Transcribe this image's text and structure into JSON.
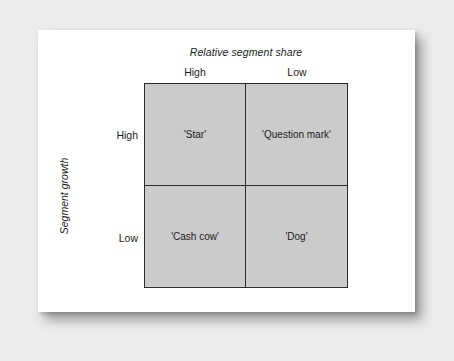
{
  "figure": {
    "x_axis_title": "Relative segment share",
    "y_axis_title": "Segment growth",
    "column_headers": [
      "High",
      "Low"
    ],
    "row_headers": [
      "High",
      "Low"
    ],
    "quadrants": [
      {
        "id": "star",
        "label": "'Star'",
        "row": "High",
        "column": "High"
      },
      {
        "id": "question-mark",
        "label": "'Question mark'",
        "row": "High",
        "column": "Low"
      },
      {
        "id": "cash-cow",
        "label": "'Cash cow'",
        "row": "Low",
        "column": "High"
      },
      {
        "id": "dog",
        "label": "'Dog'",
        "row": "Low",
        "column": "Low"
      }
    ]
  },
  "chart_data": {
    "type": "table",
    "title": "",
    "xlabel": "Relative segment share",
    "ylabel": "Segment growth",
    "x_categories": [
      "High",
      "Low"
    ],
    "y_categories": [
      "High",
      "Low"
    ],
    "cells": [
      [
        "'Star'",
        "'Question mark'"
      ],
      [
        "'Cash cow'",
        "'Dog'"
      ]
    ],
    "grid": true,
    "legend": "none"
  },
  "colors": {
    "page_background": "#ececeb",
    "card_background": "#ffffff",
    "quadrant_fill": "#cbcbcb",
    "line_color": "#2b2b2b",
    "text_color": "#1b1b1b"
  }
}
